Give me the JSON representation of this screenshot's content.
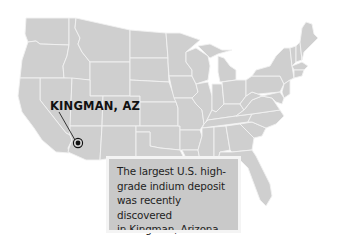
{
  "map": {
    "region": "Contiguous United States",
    "fill_color": "#cfcfcf",
    "border_color": "#f2f2f2",
    "background_color": "#ffffff"
  },
  "marker": {
    "label": "KINGMAN, AZ",
    "icon": "target-dot-icon",
    "x": 78,
    "y": 143
  },
  "caption": {
    "lines": [
      "The largest U.S. high-",
      "grade indium deposit",
      "was recently discovered",
      "in Kingman, Arizona."
    ],
    "background_color": "#c9c9c9"
  }
}
